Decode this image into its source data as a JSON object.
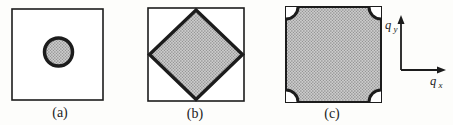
{
  "figure": {
    "panels": [
      {
        "label": "(a)",
        "shape": "circle-in-square"
      },
      {
        "label": "(b)",
        "shape": "diamond-in-square"
      },
      {
        "label": "(c)",
        "shape": "filled-square-with-corner-arcs"
      }
    ],
    "axes": {
      "y_base": "q",
      "y_sub": "y",
      "x_base": "q",
      "x_sub": "x"
    },
    "colors": {
      "line": "#1c1c1c",
      "fill_base": "#cbcbcb",
      "fill_dots": "#868686",
      "background": "#fdfdfb"
    }
  }
}
